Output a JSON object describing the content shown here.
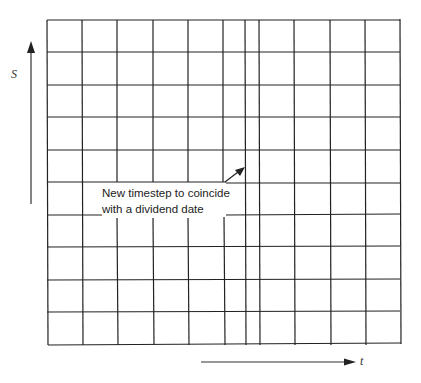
{
  "diagram": {
    "type": "finite-difference-grid",
    "y_axis_label": "S",
    "x_axis_label": "t",
    "annotation": {
      "line1": "New timestep to coincide",
      "line2": "with a dividend date"
    },
    "grid": {
      "vertical_lines_x": [
        47,
        82,
        117,
        153,
        188,
        223,
        245,
        259,
        295,
        330,
        366,
        400
      ],
      "horizontal_lines_y": [
        20,
        52,
        85,
        117,
        150,
        182,
        215,
        247,
        280,
        312,
        345
      ],
      "inserted_timestep_x": 245,
      "line_color": "#222222"
    }
  }
}
